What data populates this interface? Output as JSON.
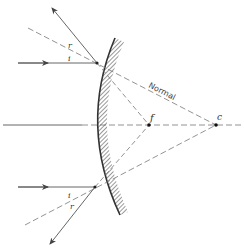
{
  "diagram": {
    "labels": {
      "normal": "Normal",
      "focal_point": "f",
      "center_of_curvature": "c",
      "upper_incident_angle": "i",
      "upper_reflected_angle": "r",
      "lower_incident_angle": "i",
      "lower_reflected_angle": "r"
    },
    "colors": {
      "line": "#555555",
      "dashed": "#777777",
      "mirror": "#333333",
      "background": "#ffffff"
    }
  }
}
